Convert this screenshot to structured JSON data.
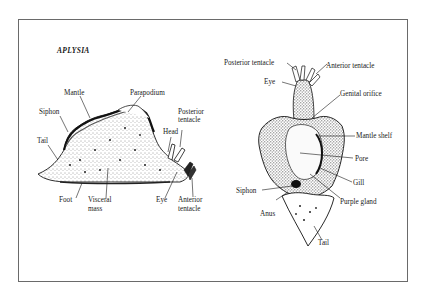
{
  "figure": {
    "title": "APLYSIA",
    "lateral_view": {
      "labels": {
        "mantle": "Mantle",
        "parapodium": "Parapodium",
        "siphon": "Siphon",
        "posterior_tentacle_1": "Posterior",
        "posterior_tentacle_2": "tentacle",
        "head": "Head",
        "tail": "Tail",
        "foot": "Foot",
        "visceral_mass_1": "Visceral",
        "visceral_mass_2": "mass",
        "eye": "Eye",
        "anterior_tentacle_1": "Anterior",
        "anterior_tentacle_2": "tentacle"
      }
    },
    "dorsal_view": {
      "labels": {
        "posterior_tentacle": "Posterior tentacle",
        "anterior_tentacle": "Anterior tentacle",
        "eye": "Eye",
        "genital_orifice": "Genital orifice",
        "mantle_shelf": "Mantle shelf",
        "pore": "Pore",
        "gill": "Gill",
        "siphon": "Siphon",
        "purple_gland": "Purple gland",
        "anus": "Anus",
        "tail": "Tail"
      }
    },
    "colors": {
      "ink": "#1a1a1a",
      "frame": "#6a6a6a",
      "background": "#ffffff"
    }
  }
}
